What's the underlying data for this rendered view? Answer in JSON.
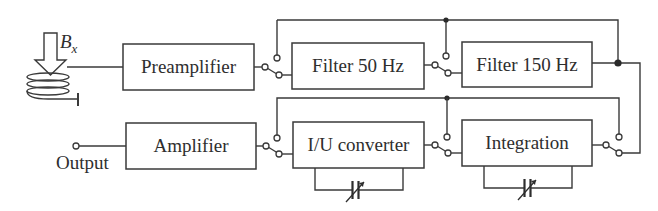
{
  "diagram": {
    "type": "block-diagram",
    "sensor": {
      "label": "B",
      "subscript": "x"
    },
    "blocks": {
      "preamplifier": "Preamplifier",
      "filter50": "Filter 50 Hz",
      "filter150": "Filter 150 Hz",
      "amplifier": "Amplifier",
      "iu_converter": "I/U converter",
      "integration": "Integration"
    },
    "output_label": "Output",
    "colors": {
      "line": "#3a3a3a",
      "text": "#2e2e2e",
      "background": "#ffffff"
    },
    "connections": [
      {
        "from": "coil",
        "to": "preamplifier"
      },
      {
        "from": "preamplifier",
        "to": "switch-1"
      },
      {
        "from": "switch-1",
        "to": "filter50"
      },
      {
        "from": "switch-1",
        "to": "bypass-top"
      },
      {
        "from": "filter50",
        "to": "switch-2"
      },
      {
        "from": "switch-2",
        "to": "filter150"
      },
      {
        "from": "switch-2",
        "to": "bypass-top"
      },
      {
        "from": "filter150",
        "to": "switch-3"
      },
      {
        "from": "bypass-top",
        "to": "filter150-output-junction"
      },
      {
        "from": "switch-3",
        "to": "integration"
      },
      {
        "from": "switch-3",
        "to": "bypass-bottom"
      },
      {
        "from": "integration",
        "to": "switch-4"
      },
      {
        "from": "switch-4",
        "to": "iu_converter"
      },
      {
        "from": "switch-4",
        "to": "bypass-bottom"
      },
      {
        "from": "iu_converter",
        "to": "switch-5"
      },
      {
        "from": "switch-5",
        "to": "amplifier"
      },
      {
        "from": "switch-5",
        "to": "bypass-bottom"
      },
      {
        "from": "amplifier",
        "to": "output"
      }
    ],
    "feedback_elements": [
      {
        "block": "iu_converter",
        "element": "variable-capacitor"
      },
      {
        "block": "integration",
        "element": "variable-capacitor"
      }
    ]
  }
}
